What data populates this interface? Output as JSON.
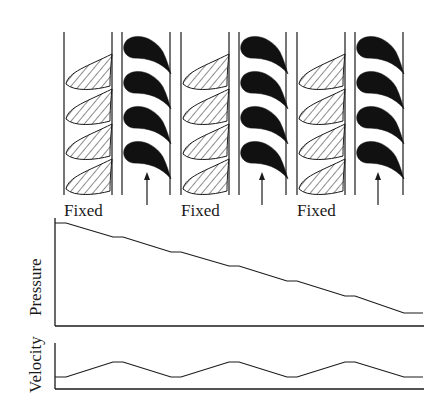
{
  "diagram": {
    "title": "",
    "stages": [
      {
        "type": "fixed",
        "label": "Fixed"
      },
      {
        "type": "moving",
        "label": ""
      },
      {
        "type": "fixed",
        "label": "Fixed"
      },
      {
        "type": "moving",
        "label": ""
      },
      {
        "type": "fixed",
        "label": "Fixed"
      },
      {
        "type": "moving",
        "label": ""
      }
    ],
    "labels": {
      "fixed_1": "Fixed",
      "fixed_2": "Fixed",
      "fixed_3": "Fixed",
      "pressure_axis": "Pressure",
      "velocity_axis": "Velocity"
    },
    "colors": {
      "ink": "#1a1a1a",
      "background": "#ffffff"
    },
    "pressure_profile": {
      "description": "Pressure drops through each fixed and moving row, with short flat steps between rows",
      "points_px": [
        [
          55,
          223
        ],
        [
          66,
          223
        ],
        [
          113,
          237
        ],
        [
          123,
          237
        ],
        [
          171,
          252
        ],
        [
          181,
          252
        ],
        [
          229,
          266
        ],
        [
          239,
          266
        ],
        [
          287,
          281
        ],
        [
          297,
          281
        ],
        [
          345,
          296
        ],
        [
          355,
          296
        ],
        [
          404,
          313
        ],
        [
          423,
          313
        ]
      ]
    },
    "velocity_profile": {
      "description": "Velocity rises through fixed rows and falls through moving rows",
      "points_px": [
        [
          55,
          377
        ],
        [
          66,
          377
        ],
        [
          113,
          362
        ],
        [
          123,
          362
        ],
        [
          171,
          377
        ],
        [
          181,
          377
        ],
        [
          229,
          362
        ],
        [
          239,
          362
        ],
        [
          287,
          377
        ],
        [
          297,
          377
        ],
        [
          345,
          362
        ],
        [
          355,
          362
        ],
        [
          404,
          377
        ],
        [
          423,
          377
        ]
      ]
    }
  }
}
